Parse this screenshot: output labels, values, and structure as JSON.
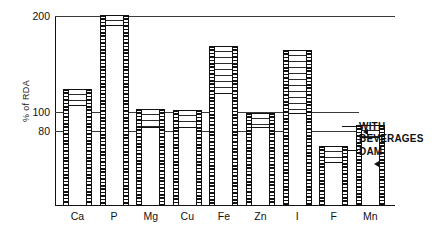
{
  "chart_data": {
    "type": "bar",
    "title": "",
    "subtitle": "",
    "xlabel": "",
    "ylabel": "% of RDA",
    "ylim": [
      0,
      200
    ],
    "ytick_labels": [
      "200",
      "100",
      "80"
    ],
    "ytick_values": [
      200,
      100,
      80
    ],
    "grid": true,
    "gridlines_at": [
      200,
      100,
      80
    ],
    "legend_position": "right-annotations",
    "categories": [
      "Ca",
      "P",
      "Mg",
      "Cu",
      "Fe",
      "Zn",
      "I",
      "F",
      "Mn"
    ],
    "stacked": true,
    "series": [
      {
        "name": "DAM",
        "fill": "solid-white",
        "values": [
          105,
          190,
          82,
          82,
          118,
          82,
          97,
          45,
          72
        ]
      },
      {
        "name": "WITH BEVERAGES",
        "fill": "stippled",
        "values": [
          17,
          10,
          19,
          18,
          49,
          15,
          66,
          17,
          12
        ]
      }
    ],
    "totals": [
      122,
      200,
      101,
      100,
      167,
      97,
      163,
      62,
      84
    ],
    "annotations": [
      {
        "id": "with-beverages",
        "text_lines": [
          "WITH",
          "BEVERAGES"
        ],
        "points_to": "Mn stippled top band"
      },
      {
        "id": "dam",
        "text_lines": [
          "DAM"
        ],
        "points_to": "Mn solid lower section"
      }
    ]
  },
  "axis": {
    "y_title": "% of RDA",
    "ticks": [
      {
        "label": "200",
        "value": 200
      },
      {
        "label": "100",
        "value": 100
      },
      {
        "label": "80",
        "value": 80
      }
    ]
  },
  "bars": [
    {
      "label": "Ca",
      "dam": 105,
      "total": 122
    },
    {
      "label": "P",
      "dam": 190,
      "total": 200
    },
    {
      "label": "Mg",
      "dam": 82,
      "total": 101
    },
    {
      "label": "Cu",
      "dam": 82,
      "total": 100
    },
    {
      "label": "Fe",
      "dam": 118,
      "total": 167
    },
    {
      "label": "Zn",
      "dam": 82,
      "total": 97
    },
    {
      "label": "I",
      "dam": 97,
      "total": 163
    },
    {
      "label": "F",
      "dam": 45,
      "total": 62
    },
    {
      "label": "Mn",
      "dam": 72,
      "total": 84
    }
  ],
  "annotations": {
    "with_beverages_line1": "WITH",
    "with_beverages_line2": "BEVERAGES",
    "dam": "DAM"
  },
  "colors": {
    "ink": "#111111",
    "paper": "#ffffff",
    "gridline": "#3a3a3a"
  }
}
